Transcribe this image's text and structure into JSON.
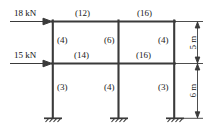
{
  "diagram": {
    "line_color": "#3a3a3a",
    "text_color": "#1a1a1a",
    "loads": [
      {
        "name": "top-lateral-load",
        "label": "18 kN",
        "level": "roof"
      },
      {
        "name": "mid-lateral-load",
        "label": "15 kN",
        "level": "first-floor"
      }
    ],
    "beam_stiffness": [
      {
        "name": "roof-beam-left",
        "label": "(12)"
      },
      {
        "name": "roof-beam-right",
        "label": "(16)"
      },
      {
        "name": "floor-beam-left",
        "label": "(14)"
      },
      {
        "name": "floor-beam-right",
        "label": "(16)"
      }
    ],
    "column_stiffness": [
      {
        "name": "upper-column-left",
        "label": "(4)"
      },
      {
        "name": "upper-column-middle",
        "label": "(6)"
      },
      {
        "name": "upper-column-right",
        "label": "(4)"
      },
      {
        "name": "lower-column-left",
        "label": "(3)"
      },
      {
        "name": "lower-column-middle",
        "label": "(4)"
      },
      {
        "name": "lower-column-right",
        "label": "(3)"
      }
    ],
    "dimensions": [
      {
        "name": "upper-storey-height",
        "label": "5 m"
      },
      {
        "name": "lower-storey-height",
        "label": "6 m"
      }
    ],
    "supports": [
      {
        "name": "support-left",
        "type": "fixed"
      },
      {
        "name": "support-middle",
        "type": "fixed"
      },
      {
        "name": "support-right",
        "type": "fixed"
      }
    ]
  }
}
